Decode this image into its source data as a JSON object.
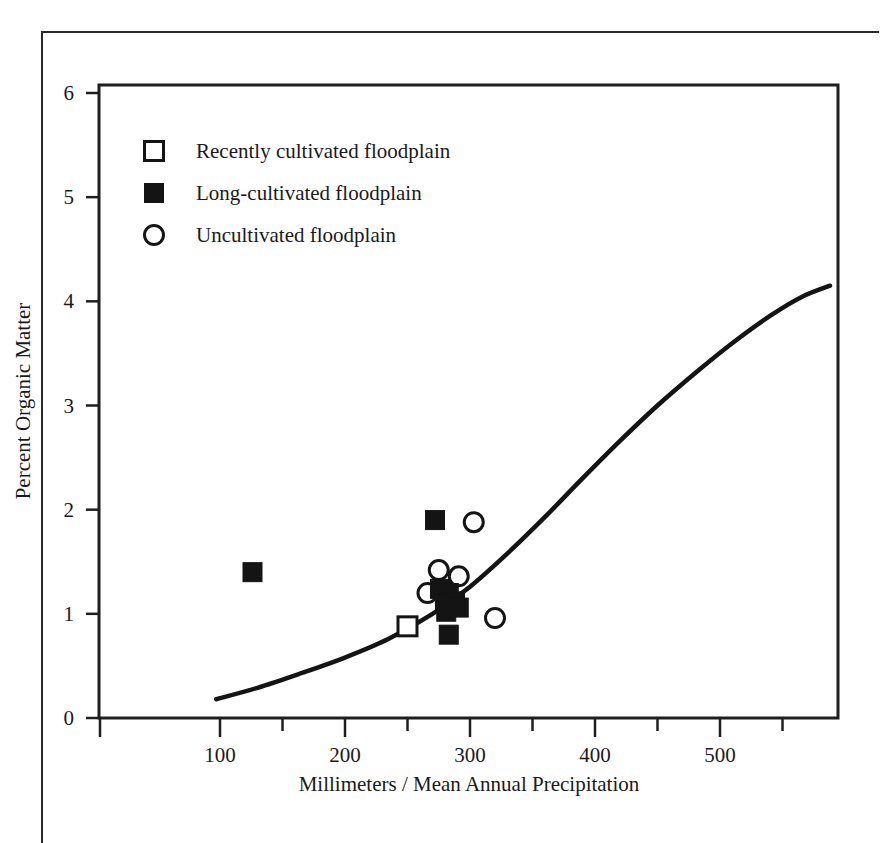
{
  "chart_data": {
    "type": "scatter",
    "title": "",
    "xlabel": "Millimeters / Mean Annual Precipitation",
    "ylabel": "Percent Organic Matter",
    "xlim": [
      40,
      590
    ],
    "ylim": [
      0,
      6.2
    ],
    "grid": false,
    "x_ticks_major": [
      100,
      200,
      300,
      400,
      500
    ],
    "x_ticks_minor": [
      150,
      250,
      350,
      450
    ],
    "x_tick_labels": [
      "100",
      "200",
      "300",
      "400",
      "500"
    ],
    "y_ticks_major": [
      0,
      1,
      2,
      3,
      4,
      5,
      6
    ],
    "y_tick_labels": [
      "0",
      "1",
      "2",
      "3",
      "4",
      "5",
      "6"
    ],
    "legend_position": "upper-left",
    "marker_color": "#141414",
    "line_color": "#141414",
    "series": [
      {
        "name": "Recently cultivated floodplain",
        "marker": "open-square",
        "points": [
          {
            "x": 250,
            "y": 0.88
          }
        ]
      },
      {
        "name": "Long-cultivated floodplain",
        "marker": "filled-square",
        "points": [
          {
            "x": 126,
            "y": 1.4
          },
          {
            "x": 272,
            "y": 1.9
          },
          {
            "x": 276,
            "y": 1.24
          },
          {
            "x": 283,
            "y": 1.2
          },
          {
            "x": 280,
            "y": 1.1
          },
          {
            "x": 288,
            "y": 1.12
          },
          {
            "x": 291,
            "y": 1.06
          },
          {
            "x": 281,
            "y": 1.02
          },
          {
            "x": 283,
            "y": 0.8
          }
        ]
      },
      {
        "name": "Uncultivated floodplain",
        "marker": "open-circle",
        "points": [
          {
            "x": 303,
            "y": 1.88
          },
          {
            "x": 275,
            "y": 1.42
          },
          {
            "x": 291,
            "y": 1.36
          },
          {
            "x": 266,
            "y": 1.2
          },
          {
            "x": 281,
            "y": 1.14
          },
          {
            "x": 320,
            "y": 0.96
          }
        ]
      }
    ],
    "fit_curve": {
      "name": "fitted trend",
      "style": "solid",
      "width_px": 4,
      "points": [
        {
          "x": 97,
          "y": 0.18
        },
        {
          "x": 130,
          "y": 0.29
        },
        {
          "x": 165,
          "y": 0.43
        },
        {
          "x": 200,
          "y": 0.58
        },
        {
          "x": 235,
          "y": 0.76
        },
        {
          "x": 270,
          "y": 1.0
        },
        {
          "x": 300,
          "y": 1.26
        },
        {
          "x": 330,
          "y": 1.58
        },
        {
          "x": 360,
          "y": 1.93
        },
        {
          "x": 390,
          "y": 2.3
        },
        {
          "x": 420,
          "y": 2.66
        },
        {
          "x": 450,
          "y": 3.0
        },
        {
          "x": 480,
          "y": 3.31
        },
        {
          "x": 510,
          "y": 3.6
        },
        {
          "x": 540,
          "y": 3.86
        },
        {
          "x": 565,
          "y": 4.04
        },
        {
          "x": 588,
          "y": 4.15
        }
      ]
    }
  },
  "legend": {
    "entries": [
      {
        "label": "Recently cultivated floodplain",
        "marker": "open-square"
      },
      {
        "label": "Long-cultivated floodplain",
        "marker": "filled-square"
      },
      {
        "label": "Uncultivated floodplain",
        "marker": "open-circle"
      }
    ]
  }
}
